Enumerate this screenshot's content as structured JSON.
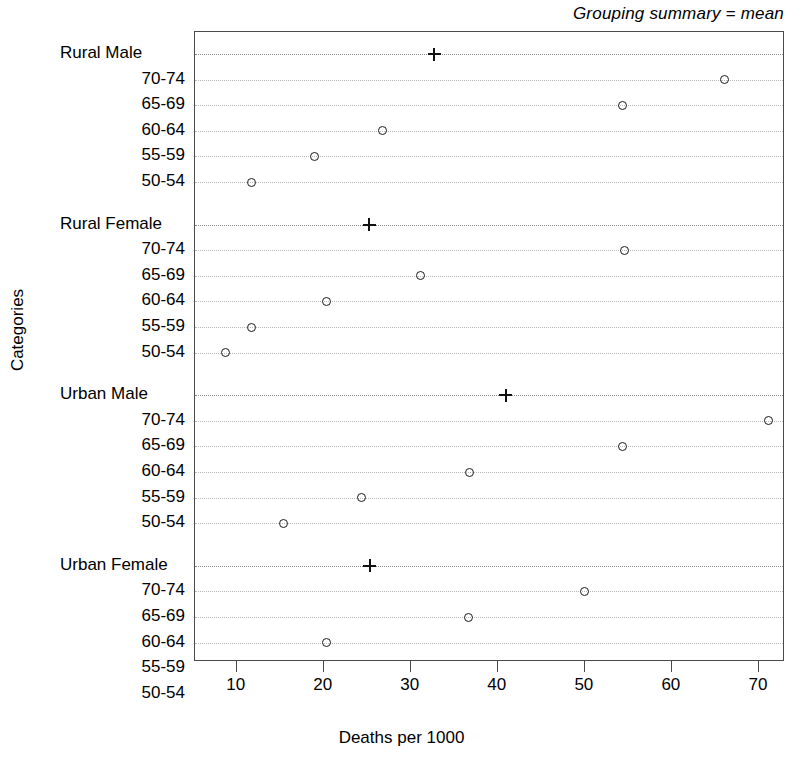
{
  "strip": {
    "label": "Grouping summary = mean"
  },
  "axes": {
    "xlabel": "Deaths per 1000",
    "ylabel": "Categories",
    "x_ticks": [
      10,
      20,
      30,
      40,
      50,
      60,
      70
    ],
    "x_tick_labels": [
      "10",
      "20",
      "30",
      "40",
      "50",
      "60",
      "70"
    ],
    "xlim": [
      5.2,
      73.0
    ]
  },
  "chart_data": {
    "type": "scatter",
    "title": "Grouping summary = mean",
    "xlabel": "Deaths per 1000",
    "ylabel": "Categories",
    "xlim": [
      5.2,
      73.0
    ],
    "grid": true,
    "legend": null,
    "marker_point": "open-circle",
    "marker_summary": "plus-cross",
    "x_ticks": [
      10,
      20,
      30,
      40,
      50,
      60,
      70
    ],
    "groups": [
      {
        "name": "Rural Male",
        "summary_label": "Rural Male",
        "summary_value": 32.7,
        "categories": [
          "70-74",
          "65-69",
          "60-64",
          "55-59",
          "50-54"
        ],
        "values": [
          66.0,
          54.3,
          26.7,
          18.9,
          11.7
        ]
      },
      {
        "name": "Rural Female",
        "summary_label": "Rural Female",
        "summary_value": 25.2,
        "categories": [
          "70-74",
          "65-69",
          "60-64",
          "55-59",
          "50-54"
        ],
        "values": [
          54.6,
          31.1,
          20.3,
          11.7,
          8.7
        ]
      },
      {
        "name": "Urban Male",
        "summary_label": "Urban Male",
        "summary_value": 40.9,
        "categories": [
          "70-74",
          "65-69",
          "60-64",
          "55-59",
          "50-54"
        ],
        "values": [
          71.1,
          54.3,
          36.8,
          24.3,
          15.4
        ]
      },
      {
        "name": "Urban Female",
        "summary_label": "Urban Female",
        "summary_value": 25.3,
        "categories": [
          "70-74",
          "65-69",
          "60-64",
          "55-59",
          "50-54"
        ],
        "values": [
          50.0,
          36.6,
          20.3,
          13.6,
          8.4
        ]
      }
    ]
  },
  "colors": {
    "marker": "#1a1a1a",
    "panel_border": "#4a4a4a",
    "gridline": "#b9b9b9",
    "gridline_group": "#8d8d8d",
    "background": "#ffffff"
  }
}
